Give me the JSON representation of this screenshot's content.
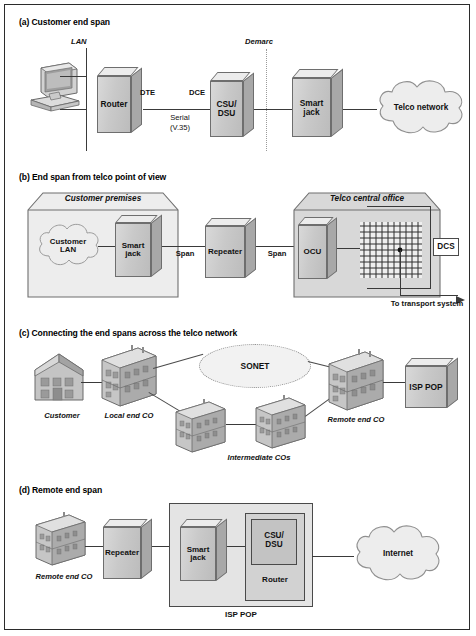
{
  "figure": {
    "panels": [
      {
        "id": "a",
        "title": "(a) Customer end span",
        "labels": {
          "lan": "LAN",
          "demarc": "Demarc",
          "dte": "DTE",
          "dce": "DCE",
          "serial": "Serial",
          "serial_sub": "(V.35)"
        },
        "nodes": [
          {
            "name": "workstation",
            "label": ""
          },
          {
            "name": "router",
            "label": "Router"
          },
          {
            "name": "csu-dsu",
            "label": "CSU/\nDSU"
          },
          {
            "name": "smart-jack",
            "label": "Smart\njack"
          },
          {
            "name": "telco-network-cloud",
            "label": "Telco network"
          }
        ]
      },
      {
        "id": "b",
        "title": "(b) End span from telco point of view",
        "labels": {
          "customer_premises": "Customer premises",
          "telco_central_office": "Telco central office",
          "span_left": "Span",
          "span_right": "Span",
          "to_transport": "To transport system"
        },
        "nodes": [
          {
            "name": "customer-lan-cloud",
            "label": "Customer\nLAN"
          },
          {
            "name": "smart-jack",
            "label": "Smart\njack"
          },
          {
            "name": "repeater",
            "label": "Repeater"
          },
          {
            "name": "ocu",
            "label": "OCU"
          },
          {
            "name": "dcs",
            "label": "DCS"
          }
        ]
      },
      {
        "id": "c",
        "title": "(c) Connecting the end spans across the telco network",
        "labels": {
          "customer": "Customer",
          "local_end_co": "Local end CO",
          "intermediate_cos": "Intermediate COs",
          "remote_end_co": "Remote end CO"
        },
        "nodes": [
          {
            "name": "sonet-cloud",
            "label": "SONET"
          },
          {
            "name": "isp-pop",
            "label": "ISP POP"
          }
        ]
      },
      {
        "id": "d",
        "title": "(d) Remote end span",
        "labels": {
          "remote_end_co": "Remote end CO",
          "isp_pop": "ISP POP"
        },
        "nodes": [
          {
            "name": "repeater",
            "label": "Repeater"
          },
          {
            "name": "smart-jack",
            "label": "Smart\njack"
          },
          {
            "name": "csu-dsu",
            "label": "CSU/\nDSU"
          },
          {
            "name": "router",
            "label": "Router"
          },
          {
            "name": "internet-cloud",
            "label": "Internet"
          }
        ]
      }
    ]
  },
  "colors": {
    "border": "#2b2b2b",
    "line": "#3a3a3a",
    "box_face": "#c9c9c9",
    "box_top": "#ececec",
    "box_side": "#a8a8a8",
    "cloud_fill": "#ededed",
    "shade": "#d6d6d6"
  }
}
